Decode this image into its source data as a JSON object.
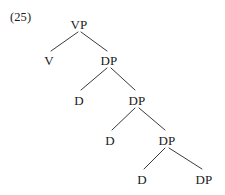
{
  "figure": {
    "example_number": "(25)",
    "example_number_pos": {
      "x": 10,
      "y": 11
    },
    "type": "syntax-tree",
    "line_color": "#3a3a3a",
    "text_color": "#1a1a1a",
    "background_color": "#ffffff",
    "width": 225,
    "height": 195
  },
  "nodes": [
    {
      "id": "vp",
      "label": "VP",
      "x": 79,
      "y": 18,
      "level": 0
    },
    {
      "id": "v",
      "label": "V",
      "x": 49,
      "y": 54,
      "level": 1
    },
    {
      "id": "dp1",
      "label": "DP",
      "x": 109,
      "y": 54,
      "level": 1
    },
    {
      "id": "d1",
      "label": "D",
      "x": 79,
      "y": 94,
      "level": 2
    },
    {
      "id": "dp2",
      "label": "DP",
      "x": 137,
      "y": 94,
      "level": 2
    },
    {
      "id": "d2",
      "label": "D",
      "x": 110,
      "y": 134,
      "level": 3
    },
    {
      "id": "dp3",
      "label": "DP",
      "x": 167,
      "y": 134,
      "level": 3
    },
    {
      "id": "d3",
      "label": "D",
      "x": 142,
      "y": 173,
      "level": 4
    },
    {
      "id": "dp4",
      "label": "DP",
      "x": 204,
      "y": 173,
      "level": 4
    }
  ],
  "edges": [
    {
      "from": "vp",
      "to": "v",
      "x1": 78,
      "y1": 32,
      "x2": 51,
      "y2": 51
    },
    {
      "from": "vp",
      "to": "dp1",
      "x1": 81,
      "y1": 32,
      "x2": 107,
      "y2": 51
    },
    {
      "from": "dp1",
      "to": "d1",
      "x1": 107,
      "y1": 68,
      "x2": 81,
      "y2": 90
    },
    {
      "from": "dp1",
      "to": "dp2",
      "x1": 111,
      "y1": 68,
      "x2": 135,
      "y2": 90
    },
    {
      "from": "dp2",
      "to": "d2",
      "x1": 135,
      "y1": 108,
      "x2": 112,
      "y2": 130
    },
    {
      "from": "dp2",
      "to": "dp3",
      "x1": 139,
      "y1": 108,
      "x2": 165,
      "y2": 130
    },
    {
      "from": "dp3",
      "to": "d3",
      "x1": 165,
      "y1": 148,
      "x2": 144,
      "y2": 169
    },
    {
      "from": "dp3",
      "to": "dp4",
      "x1": 169,
      "y1": 148,
      "x2": 202,
      "y2": 169
    }
  ]
}
